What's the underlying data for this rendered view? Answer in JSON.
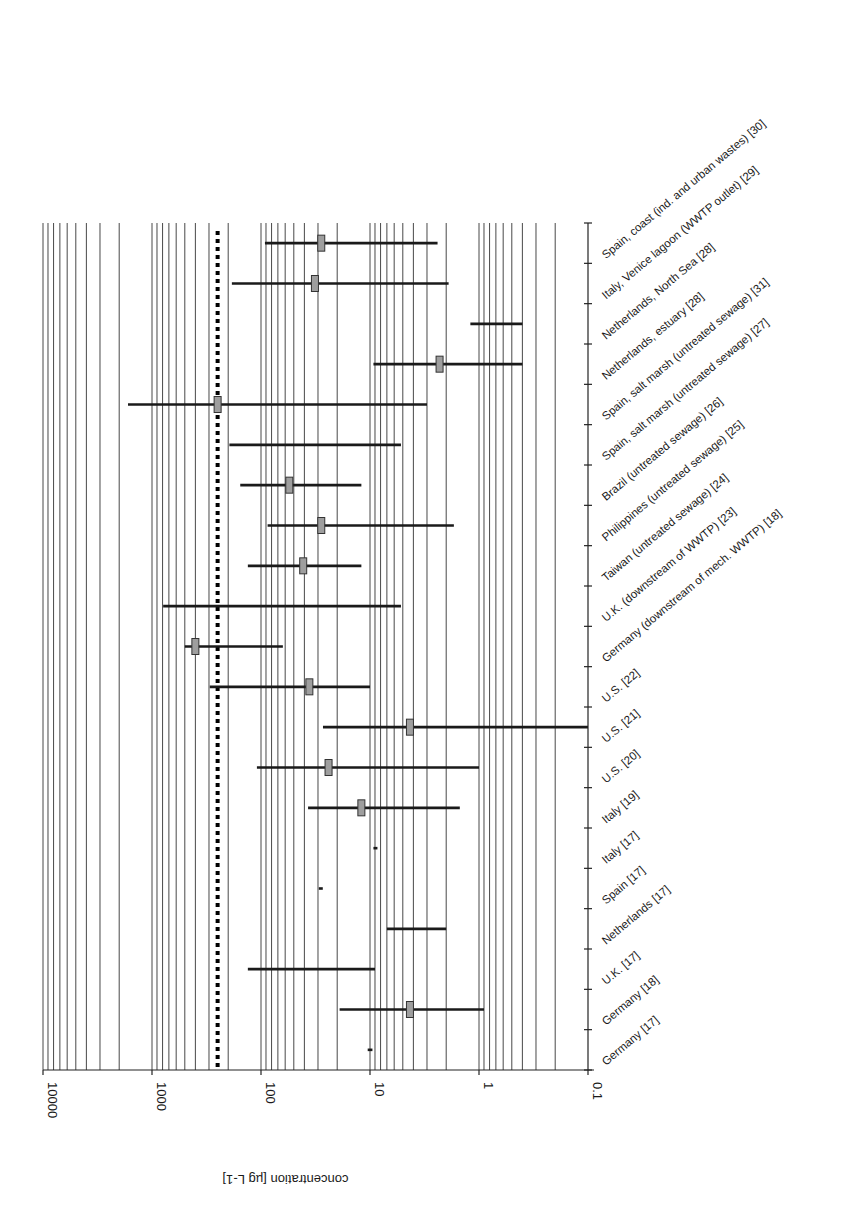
{
  "chart_data": {
    "type": "range-bar",
    "orientation": "horizontal, x-axis reversed (log scale)",
    "xlabel": "concentration [µg L-1]",
    "x_scale": "log",
    "xlim": [
      10000,
      0.1
    ],
    "x_ticks": [
      "10000",
      "1000",
      "100",
      "10",
      "1",
      "0.1"
    ],
    "x_tick_values": [
      10000,
      1000,
      100,
      10,
      1,
      0.1
    ],
    "grid": {
      "vertical_minor_log": true
    },
    "reference_line": {
      "value": 250,
      "style": "dotted",
      "color": "#000000"
    },
    "categories": [
      "Spain, coast (ind. and urban wastes) [30]",
      "Italy, Venice lagoon (WWTP outlet) [29]",
      "Netherlands, North Sea [28]",
      "Netherlands, estuary [28]",
      "Spain, salt marsh (untreated sewage) [31]",
      "Spain, salt marsh (untreated sewage) [27]",
      "Brazil (untreated sewage) [26]",
      "Philippines (untreated sewage) [25]",
      "Taiwan (untreated sewage) [24]",
      "U.K. (downstream of WWTP) [23]",
      "Germany (downstream of mech. WWTP) [18]",
      "U.S. [22]",
      "U.S. [21]",
      "U.S. [20]",
      "Italy [19]",
      "Italy [17]",
      "Spain [17]",
      "Netherlands [17]",
      "U.K. [17]",
      "Germany [18]",
      "Germany [17]"
    ],
    "series": [
      {
        "name": "max",
        "values": [
          92,
          185,
          1.2,
          9.3,
          1660,
          195,
          155,
          87,
          132,
          790,
          500,
          295,
          27,
          109,
          37,
          9.3,
          29.5,
          7,
          132,
          19,
          10.5
        ]
      },
      {
        "name": "min",
        "values": [
          2.4,
          1.9,
          0.4,
          0.4,
          3,
          5.2,
          12,
          1.7,
          12,
          5.2,
          63,
          10,
          0.1,
          1.0,
          1.5,
          8.7,
          28.5,
          2,
          9,
          0.9,
          9.5
        ]
      },
      {
        "name": "mean",
        "values": [
          28,
          32,
          null,
          2.3,
          250,
          null,
          55,
          28,
          41,
          null,
          400,
          36,
          4.3,
          24,
          12,
          null,
          null,
          null,
          null,
          4.3,
          null
        ]
      }
    ],
    "colors": {
      "range_line": "#1a1a1a",
      "mean_box_fill": "#9e9e9e",
      "mean_box_stroke": "#333333",
      "grid": "#333333",
      "reference_line": "#000000"
    }
  }
}
